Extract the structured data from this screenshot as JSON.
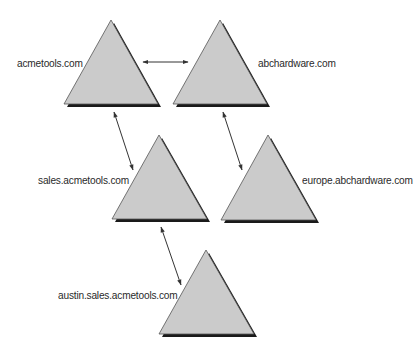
{
  "colors": {
    "triangle_fill": "#cbcbcb",
    "triangle_stroke": "#555555",
    "shadow": "#1a1a1a",
    "arrow": "#333333",
    "label_text": "#2a2a2a",
    "background": "#ffffff"
  },
  "domains": [
    {
      "id": "acmetools",
      "label": "acmetools.com",
      "apex": [
        111,
        20
      ],
      "base_left": [
        64,
        104
      ],
      "base_right": [
        158,
        104
      ],
      "label_pos": [
        17,
        57
      ]
    },
    {
      "id": "abchardware",
      "label": "abchardware.com",
      "apex": [
        220,
        20
      ],
      "base_left": [
        173,
        104
      ],
      "base_right": [
        267,
        104
      ],
      "label_pos": [
        258,
        57
      ]
    },
    {
      "id": "sales-acmetools",
      "label": "sales.acmetools.com",
      "apex": [
        159,
        135
      ],
      "base_left": [
        112,
        219
      ],
      "base_right": [
        207,
        219
      ],
      "label_pos": [
        38,
        174
      ]
    },
    {
      "id": "europe-abchardware",
      "label": "europe.abchardware.com",
      "apex": [
        268,
        135
      ],
      "base_left": [
        221,
        220
      ],
      "base_right": [
        316,
        220
      ],
      "label_pos": [
        302,
        174
      ]
    },
    {
      "id": "austin-sales-acmetools",
      "label": "austin.sales.acmetools.com",
      "apex": [
        206,
        250
      ],
      "base_left": [
        159,
        334
      ],
      "base_right": [
        254,
        334
      ],
      "label_pos": [
        58,
        289
      ]
    }
  ],
  "trusts": [
    {
      "from": "acmetools",
      "to": "abchardware",
      "start": [
        143,
        62
      ],
      "end": [
        188,
        62
      ],
      "type": "two-way"
    },
    {
      "from": "acmetools",
      "to": "sales-acmetools",
      "start": [
        114,
        112
      ],
      "end": [
        133,
        170
      ],
      "type": "two-way"
    },
    {
      "from": "abchardware",
      "to": "europe-abchardware",
      "start": [
        223,
        112
      ],
      "end": [
        242,
        170
      ],
      "type": "two-way"
    },
    {
      "from": "sales-acmetools",
      "to": "austin-sales-acmetools",
      "start": [
        161,
        227
      ],
      "end": [
        181,
        285
      ],
      "type": "two-way"
    }
  ]
}
